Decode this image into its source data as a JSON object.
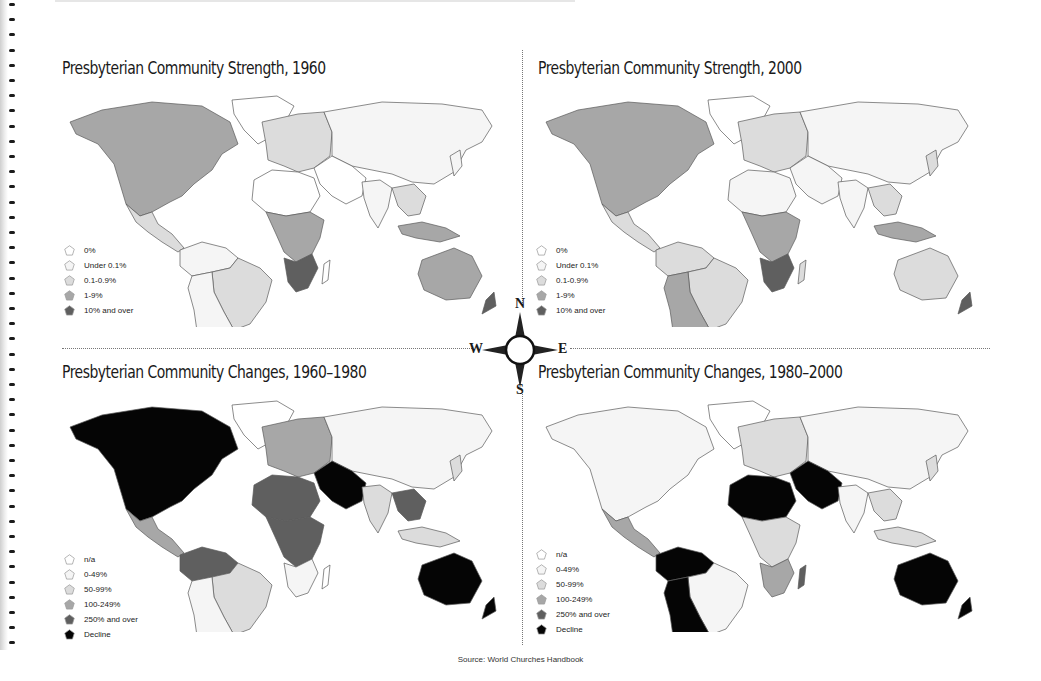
{
  "page": {
    "source": "Source: World Churches Handbook",
    "binding_hole_count": 43,
    "binding_hole_start_y": 3,
    "binding_hole_spacing": 15.2
  },
  "compass": {
    "north": "N",
    "south": "S",
    "east": "E",
    "west": "W"
  },
  "colors": {
    "outline": "#5a5a5a",
    "level_0": "#ffffff",
    "level_1": "#f5f5f5",
    "level_2": "#dcdcdc",
    "level_3": "#a7a7a7",
    "level_4": "#5f5f5f",
    "level_5": "#050505"
  },
  "maps": {
    "strength_1960": {
      "title": "Presbyterian Community Strength, 1960",
      "legend": [
        {
          "label": "0%",
          "color": "#ffffff"
        },
        {
          "label": "Under 0.1%",
          "color": "#f5f5f5"
        },
        {
          "label": "0.1-0.9%",
          "color": "#dcdcdc"
        },
        {
          "label": "1-9%",
          "color": "#a7a7a7"
        },
        {
          "label": "10% and over",
          "color": "#5f5f5f"
        }
      ],
      "regions": {
        "north_america": "#a7a7a7",
        "greenland": "#ffffff",
        "mexico_central": "#dcdcdc",
        "south_america_north": "#f5f5f5",
        "brazil": "#dcdcdc",
        "south_america_south": "#f5f5f5",
        "europe": "#dcdcdc",
        "russia_asia": "#f5f5f5",
        "middle_east": "#ffffff",
        "india": "#f5f5f5",
        "north_africa": "#ffffff",
        "central_africa": "#a7a7a7",
        "southern_africa": "#5f5f5f",
        "madagascar": "#ffffff",
        "southeast_asia": "#dcdcdc",
        "indonesia": "#a7a7a7",
        "australia": "#a7a7a7",
        "new_zealand": "#5f5f5f",
        "japan": "#f5f5f5"
      }
    },
    "strength_2000": {
      "title": "Presbyterian Community Strength, 2000",
      "legend": [
        {
          "label": "0%",
          "color": "#ffffff"
        },
        {
          "label": "Under 0.1%",
          "color": "#f5f5f5"
        },
        {
          "label": "0.1-0.9%",
          "color": "#dcdcdc"
        },
        {
          "label": "1-9%",
          "color": "#a7a7a7"
        },
        {
          "label": "10% and over",
          "color": "#5f5f5f"
        }
      ],
      "regions": {
        "north_america": "#a7a7a7",
        "greenland": "#ffffff",
        "mexico_central": "#dcdcdc",
        "south_america_north": "#dcdcdc",
        "brazil": "#dcdcdc",
        "south_america_south": "#a7a7a7",
        "europe": "#dcdcdc",
        "russia_asia": "#f5f5f5",
        "middle_east": "#f5f5f5",
        "india": "#f5f5f5",
        "north_africa": "#f5f5f5",
        "central_africa": "#a7a7a7",
        "southern_africa": "#5f5f5f",
        "madagascar": "#dcdcdc",
        "southeast_asia": "#dcdcdc",
        "indonesia": "#a7a7a7",
        "australia": "#dcdcdc",
        "new_zealand": "#5f5f5f",
        "japan": "#dcdcdc"
      }
    },
    "changes_1960_1980": {
      "title": "Presbyterian Community Changes, 1960–1980",
      "legend": [
        {
          "label": "n/a",
          "color": "#ffffff"
        },
        {
          "label": "0-49%",
          "color": "#f5f5f5"
        },
        {
          "label": "50-99%",
          "color": "#dcdcdc"
        },
        {
          "label": "100-249%",
          "color": "#a7a7a7"
        },
        {
          "label": "250% and over",
          "color": "#5f5f5f"
        },
        {
          "label": "Decline",
          "color": "#050505"
        }
      ],
      "regions": {
        "north_america": "#050505",
        "greenland": "#ffffff",
        "mexico_central": "#a7a7a7",
        "south_america_north": "#5f5f5f",
        "brazil": "#dcdcdc",
        "south_america_south": "#f5f5f5",
        "europe": "#a7a7a7",
        "russia_asia": "#f5f5f5",
        "middle_east": "#050505",
        "india": "#dcdcdc",
        "north_africa": "#5f5f5f",
        "central_africa": "#5f5f5f",
        "southern_africa": "#f5f5f5",
        "madagascar": "#ffffff",
        "southeast_asia": "#5f5f5f",
        "indonesia": "#dcdcdc",
        "australia": "#050505",
        "new_zealand": "#050505",
        "japan": "#dcdcdc"
      }
    },
    "changes_1980_2000": {
      "title": "Presbyterian Community Changes, 1980–2000",
      "legend": [
        {
          "label": "n/a",
          "color": "#ffffff"
        },
        {
          "label": "0-49%",
          "color": "#f5f5f5"
        },
        {
          "label": "50-99%",
          "color": "#dcdcdc"
        },
        {
          "label": "100-249%",
          "color": "#a7a7a7"
        },
        {
          "label": "250% and over",
          "color": "#5f5f5f"
        },
        {
          "label": "Decline",
          "color": "#050505"
        }
      ],
      "regions": {
        "north_america": "#f5f5f5",
        "greenland": "#ffffff",
        "mexico_central": "#a7a7a7",
        "south_america_north": "#050505",
        "brazil": "#f5f5f5",
        "south_america_south": "#050505",
        "europe": "#dcdcdc",
        "russia_asia": "#f5f5f5",
        "middle_east": "#050505",
        "india": "#f5f5f5",
        "north_africa": "#050505",
        "central_africa": "#dcdcdc",
        "southern_africa": "#a7a7a7",
        "madagascar": "#5f5f5f",
        "southeast_asia": "#dcdcdc",
        "indonesia": "#dcdcdc",
        "australia": "#050505",
        "new_zealand": "#050505",
        "japan": "#dcdcdc"
      }
    }
  }
}
